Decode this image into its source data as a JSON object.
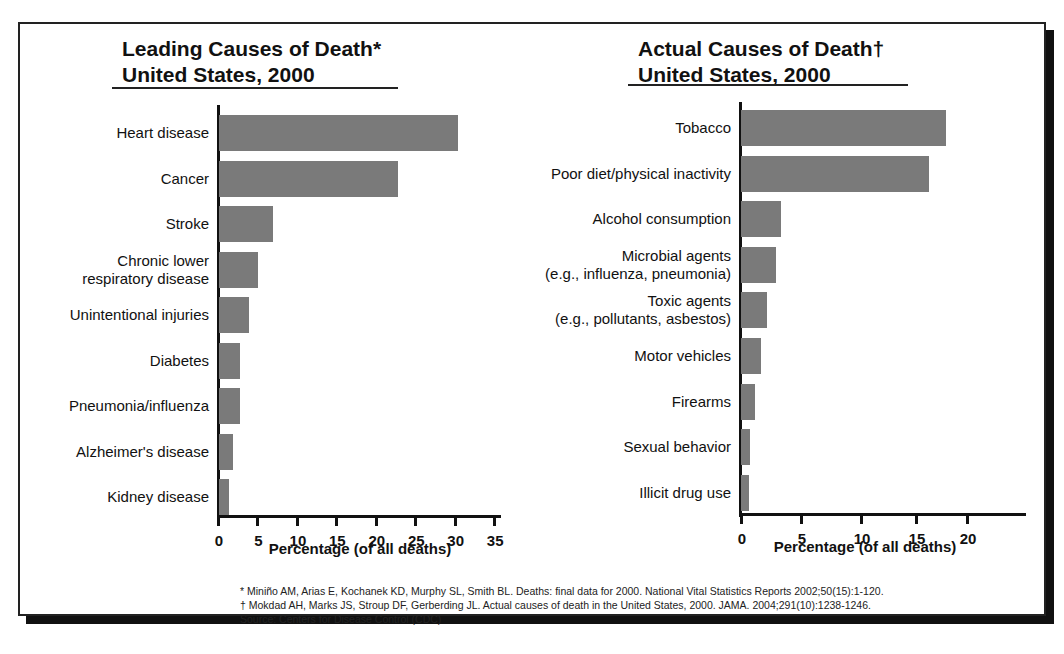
{
  "left": {
    "title_line1": "Leading Causes of Death*",
    "title_line2": "United States, 2000",
    "xlabel": "Percentage (of all deaths)",
    "ticks": [
      "0",
      "5",
      "10",
      "15",
      "20",
      "25",
      "30",
      "35"
    ]
  },
  "right": {
    "title_line1": "Actual Causes of Death†",
    "title_line2": "United States, 2000",
    "xlabel": "Percentage (of all deaths)",
    "ticks": [
      "0",
      "5",
      "10",
      "15",
      "20"
    ]
  },
  "footnotes": {
    "note1": "* Miniño AM, Arias E, Kochanek KD, Murphy SL, Smith BL. Deaths: final data for 2000. National Vital Statistics Reports 2002;50(15):1-120.",
    "note2": "† Mokdad AH, Marks JS, Stroup DF, Gerberding JL. Actual causes of death in the United States, 2000. JAMA. 2004;291(10):1238-1246.",
    "source": "Source: Centers for Disease Control (CDC)"
  },
  "chart_data": [
    {
      "type": "bar",
      "orientation": "horizontal",
      "title": "Leading Causes of Death* United States, 2000",
      "xlabel": "Percentage (of all deaths)",
      "ylabel": "",
      "xlim": [
        0,
        35
      ],
      "xticks": [
        0,
        5,
        10,
        15,
        20,
        25,
        30,
        35
      ],
      "grid": false,
      "categories": [
        "Heart disease",
        "Cancer",
        "Stroke",
        "Chronic lower\nrespiratory disease",
        "Unintentional injuries",
        "Diabetes",
        "Pneumonia/influenza",
        "Alzheimer's disease",
        "Kidney disease"
      ],
      "values": [
        30.3,
        22.7,
        6.8,
        5.0,
        3.8,
        2.7,
        2.7,
        1.8,
        1.3
      ],
      "bar_color": "#7a7a7a"
    },
    {
      "type": "bar",
      "orientation": "horizontal",
      "title": "Actual Causes of Death† United States, 2000",
      "xlabel": "Percentage (of all deaths)",
      "ylabel": "",
      "xlim": [
        0,
        25
      ],
      "xticks": [
        0,
        5,
        10,
        15,
        20
      ],
      "grid": false,
      "categories": [
        "Tobacco",
        "Poor diet/physical inactivity",
        "Alcohol consumption",
        "Microbial agents\n(e.g., influenza, pneumonia)",
        "Toxic agents\n(e.g., pollutants, asbestos)",
        "Motor vehicles",
        "Firearms",
        "Sexual behavior",
        "Illicit drug use"
      ],
      "values": [
        18.1,
        16.6,
        3.5,
        3.1,
        2.3,
        1.8,
        1.2,
        0.8,
        0.7
      ],
      "bar_color": "#7a7a7a"
    }
  ]
}
